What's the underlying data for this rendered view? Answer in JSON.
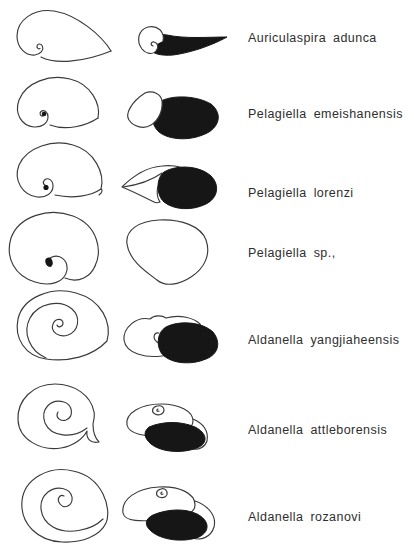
{
  "figure": {
    "type": "species-shell-morphology-plate",
    "colors": {
      "background": "#ffffff",
      "line_ink": "#3a3a3a",
      "solid_fill": "#161616"
    },
    "rows": [
      {
        "label": "Auriculaspira adunca"
      },
      {
        "label": "Pelagiella emeishanensis"
      },
      {
        "label": "Pelagiella lorenzi"
      },
      {
        "label": "Pelagiella sp.,"
      },
      {
        "label": "Aldanella yangjiaheensis"
      },
      {
        "label": "Aldanella attleborensis"
      },
      {
        "label": "Aldanella rozanovi"
      }
    ]
  }
}
